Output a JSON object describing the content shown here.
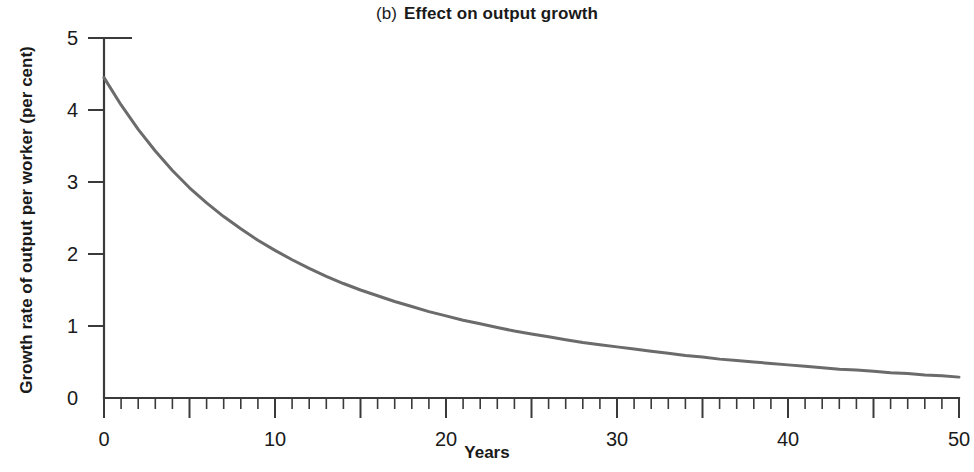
{
  "chart_data": {
    "type": "line",
    "panel_letter": "(b)",
    "title_main": "Effect on output growth",
    "xlabel": "Years",
    "ylabel": "Growth rate of output per worker (per cent)",
    "xlim": [
      0,
      50
    ],
    "ylim": [
      0,
      5
    ],
    "grid": false,
    "legend": null,
    "x_tick_labels": [
      "0",
      "10",
      "20",
      "30",
      "40",
      "50"
    ],
    "x_tick_values": [
      0,
      10,
      20,
      30,
      40,
      50
    ],
    "x_minor_tick_step": 1,
    "x_major_tick_step": 5,
    "y_tick_labels": [
      "0",
      "1",
      "2",
      "3",
      "4",
      "5"
    ],
    "y_tick_values": [
      0,
      1,
      2,
      3,
      4,
      5
    ],
    "series": [
      {
        "name": "Growth rate of output per worker",
        "color": "#6b6b6b",
        "x": [
          0,
          1,
          2,
          3,
          4,
          5,
          6,
          7,
          8,
          9,
          10,
          11,
          12,
          13,
          14,
          15,
          16,
          17,
          18,
          19,
          20,
          21,
          22,
          23,
          24,
          25,
          26,
          27,
          28,
          29,
          30,
          31,
          32,
          33,
          34,
          35,
          36,
          37,
          38,
          39,
          40,
          41,
          42,
          43,
          44,
          45,
          46,
          47,
          48,
          49,
          50
        ],
        "values": [
          4.45,
          4.07,
          3.73,
          3.43,
          3.16,
          2.92,
          2.71,
          2.52,
          2.35,
          2.19,
          2.05,
          1.92,
          1.8,
          1.69,
          1.59,
          1.5,
          1.42,
          1.34,
          1.27,
          1.2,
          1.14,
          1.08,
          1.03,
          0.98,
          0.93,
          0.89,
          0.85,
          0.81,
          0.77,
          0.74,
          0.71,
          0.68,
          0.65,
          0.62,
          0.59,
          0.57,
          0.54,
          0.52,
          0.5,
          0.48,
          0.46,
          0.44,
          0.42,
          0.4,
          0.39,
          0.37,
          0.35,
          0.34,
          0.32,
          0.31,
          0.29
        ]
      }
    ]
  },
  "colors": {
    "curve": "#6b6b6b",
    "axis": "#3a3a3a",
    "text": "#1a1a1a",
    "background": "#ffffff"
  }
}
